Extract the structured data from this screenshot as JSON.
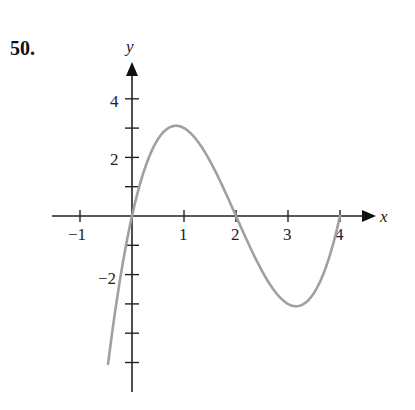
{
  "problem_number": "50.",
  "chart_data": {
    "type": "line",
    "title": "",
    "xlabel": "x",
    "ylabel": "y",
    "function": "y = x(x-2)(x-4)",
    "xlim": [
      -1.5,
      4.5
    ],
    "ylim": [
      -6,
      5
    ],
    "grid": false,
    "x_ticks": [
      -1,
      1,
      2,
      3,
      4
    ],
    "x_tick_labels": [
      "−1",
      "1",
      "2",
      "3",
      "4"
    ],
    "y_ticks": [
      -5,
      -4,
      -3,
      -2,
      -1,
      1,
      2,
      3,
      4
    ],
    "y_tick_labels": [
      "",
      "",
      "",
      "−2",
      "",
      "",
      "2",
      "",
      "4"
    ],
    "series": [
      {
        "name": "curve",
        "color": "#a0a0a0",
        "x": [
          -0.46,
          -0.25,
          0,
          0.25,
          0.5,
          0.85,
          1.25,
          1.5,
          2,
          2.5,
          2.75,
          3.15,
          3.5,
          3.75,
          4
        ],
        "y": [
          -5.05,
          -2.39,
          0,
          1.64,
          2.63,
          3.08,
          2.58,
          1.88,
          0,
          -1.88,
          -2.58,
          -3.08,
          -2.63,
          -1.64,
          0
        ]
      }
    ],
    "key_points": {
      "roots": [
        0,
        2,
        4
      ],
      "local_max": [
        0.85,
        3.08
      ],
      "local_min": [
        3.15,
        -3.08
      ]
    }
  },
  "labels": {
    "x_axis": "x",
    "y_axis": "y",
    "xt_m1": "−1",
    "xt_1": "1",
    "xt_2": "2",
    "xt_3": "3",
    "xt_4": "4",
    "yt_4": "4",
    "yt_2": "2",
    "yt_m2": "−2"
  }
}
